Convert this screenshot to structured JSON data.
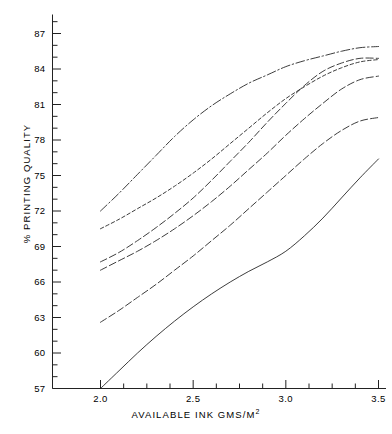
{
  "chart_data": {
    "type": "line",
    "title": "",
    "xlabel": "AVAILABLE INK  GMS/M²",
    "xlabel_base": "AVAILABLE INK  GMS/M",
    "xlabel_sup": "2",
    "ylabel": "% PRINTING QUALITY",
    "xlim": [
      1.88,
      3.52
    ],
    "ylim": [
      57,
      88.3
    ],
    "grid": false,
    "legend": "none",
    "x_ticks_major": [
      "2.0",
      "2.5",
      "3.0",
      "3.5"
    ],
    "x_ticks_major_values": [
      2.0,
      2.5,
      3.0,
      3.5
    ],
    "x_ticks_minor_values": [
      2.125,
      2.25,
      2.375,
      2.625,
      2.75,
      2.875,
      3.125,
      3.25,
      3.375
    ],
    "y_ticks_major": [
      "57",
      "60",
      "63",
      "66",
      "69",
      "72",
      "75",
      "78",
      "81",
      "84",
      "87"
    ],
    "y_ticks_major_values": [
      57,
      60,
      63,
      66,
      69,
      72,
      75,
      78,
      81,
      84,
      87
    ],
    "y_ticks_minor_values": [
      58,
      59,
      61,
      62,
      64,
      65,
      67,
      68,
      70,
      71,
      73,
      74,
      76,
      77,
      79,
      80,
      82,
      83,
      85,
      86,
      88
    ],
    "x": [
      2.0,
      2.1,
      2.2,
      2.3,
      2.4,
      2.5,
      2.6,
      2.7,
      2.8,
      2.9,
      3.0,
      3.1,
      3.2,
      3.3,
      3.4,
      3.5
    ],
    "series": [
      {
        "name": "curve-1-top",
        "style": "dash-dot",
        "color": "#1a1a1a",
        "values": [
          72.0,
          73.5,
          75.1,
          76.7,
          78.3,
          79.7,
          80.9,
          81.9,
          82.8,
          83.5,
          84.2,
          84.7,
          85.1,
          85.5,
          85.8,
          85.9
        ]
      },
      {
        "name": "curve-2-short-dash",
        "style": "short-dash",
        "color": "#1a1a1a",
        "values": [
          70.5,
          71.3,
          72.2,
          73.1,
          74.1,
          75.2,
          76.4,
          77.7,
          79.0,
          80.3,
          81.5,
          82.5,
          83.4,
          84.1,
          84.6,
          84.8
        ]
      },
      {
        "name": "curve-3-long-dash",
        "style": "long-dash",
        "color": "#1a1a1a",
        "values": [
          67.7,
          68.5,
          69.5,
          70.6,
          71.8,
          73.1,
          74.6,
          76.2,
          77.8,
          79.5,
          81.1,
          82.6,
          83.8,
          84.5,
          84.9,
          84.9
        ]
      },
      {
        "name": "curve-4-long-dash",
        "style": "long-dash",
        "color": "#1a1a1a",
        "values": [
          67.0,
          67.8,
          68.6,
          69.5,
          70.5,
          71.6,
          72.8,
          74.1,
          75.5,
          76.9,
          78.4,
          79.8,
          81.1,
          82.3,
          83.1,
          83.4
        ]
      },
      {
        "name": "curve-5-long-dash",
        "style": "long-dash",
        "color": "#1a1a1a",
        "values": [
          62.6,
          63.6,
          64.7,
          65.8,
          67.0,
          68.2,
          69.5,
          70.8,
          72.2,
          73.6,
          75.0,
          76.4,
          77.7,
          78.8,
          79.6,
          79.9
        ]
      },
      {
        "name": "curve-6-solid",
        "style": "solid",
        "color": "#1a1a1a",
        "values": [
          57.0,
          58.5,
          60.0,
          61.4,
          62.7,
          63.9,
          65.0,
          66.0,
          66.9,
          67.7,
          68.6,
          69.9,
          71.4,
          73.1,
          74.8,
          76.4
        ]
      }
    ]
  }
}
